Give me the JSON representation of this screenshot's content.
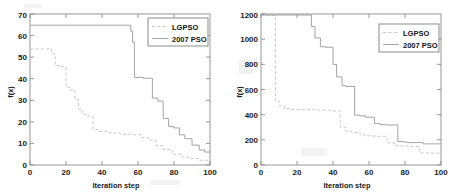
{
  "figure": {
    "panel_count": 2,
    "background_color": "#ffffff"
  },
  "chart_data": [
    {
      "type": "line",
      "panel": "left",
      "title": "",
      "xlabel": "Iteration step",
      "ylabel": "f(x)",
      "xlim": [
        0,
        100
      ],
      "ylim": [
        0,
        70
      ],
      "xticks": [
        0,
        20,
        40,
        60,
        80,
        100
      ],
      "yticks": [
        0,
        10,
        20,
        30,
        40,
        50,
        60,
        70
      ],
      "grid": false,
      "legend_position": "upper right",
      "legend": [
        "LGPSO",
        "2007 PSO"
      ],
      "series": [
        {
          "name": "LGPSO",
          "style": "dashed",
          "color": "#c2c2c2",
          "x": [
            0,
            12,
            12,
            14,
            14,
            17,
            17,
            20,
            20,
            22,
            22,
            25,
            25,
            27,
            27,
            29,
            29,
            31,
            31,
            33,
            33,
            35,
            35,
            38,
            38,
            44,
            44,
            50,
            50,
            56,
            56,
            62,
            62,
            66,
            66,
            70,
            70,
            74,
            74,
            79,
            79,
            84,
            84,
            89,
            89,
            94,
            94,
            100
          ],
          "y": [
            53.8,
            53.8,
            51.5,
            51.5,
            46.2,
            46.2,
            45.6,
            45.6,
            36.0,
            36.0,
            34.8,
            34.8,
            30.5,
            30.5,
            26.0,
            26.0,
            23.5,
            23.5,
            22.8,
            22.8,
            22.5,
            22.5,
            16.5,
            16.5,
            15.6,
            15.6,
            14.9,
            14.9,
            14.2,
            14.2,
            14.0,
            14.0,
            12.8,
            12.8,
            11.6,
            11.6,
            9.0,
            9.0,
            7.2,
            7.2,
            5.0,
            5.0,
            3.7,
            3.7,
            3.0,
            3.0,
            2.2,
            2.2
          ]
        },
        {
          "name": "2007 PSO",
          "style": "solid",
          "color": "#9a9a9a",
          "x": [
            0,
            56,
            56,
            57,
            57,
            58,
            58,
            63,
            63,
            68,
            68,
            71,
            71,
            74,
            74,
            77,
            77,
            80,
            80,
            83,
            83,
            86,
            86,
            90,
            90,
            94,
            94,
            97,
            97,
            100
          ],
          "y": [
            64.8,
            64.8,
            62.0,
            62.0,
            57.0,
            57.0,
            40.6,
            40.6,
            40.2,
            40.2,
            31.0,
            31.0,
            29.6,
            29.6,
            21.5,
            21.5,
            17.8,
            17.8,
            17.2,
            17.2,
            14.0,
            14.0,
            12.2,
            12.2,
            9.2,
            9.2,
            7.0,
            7.0,
            6.0,
            6.0
          ]
        }
      ]
    },
    {
      "type": "line",
      "panel": "right",
      "title": "",
      "xlabel": "Iteration step",
      "ylabel": "f(x)",
      "xlim": [
        0,
        100
      ],
      "ylim": [
        0,
        1200
      ],
      "xticks": [
        0,
        20,
        40,
        60,
        80,
        100
      ],
      "yticks": [
        0,
        200,
        400,
        600,
        800,
        1000,
        1200
      ],
      "grid": false,
      "legend_position": "upper right",
      "legend": [
        "LGPSO",
        "2007 PSO"
      ],
      "series": [
        {
          "name": "LGPSO",
          "style": "dashed",
          "color": "#c2c2c2",
          "x": [
            0,
            8,
            8,
            10,
            10,
            13,
            13,
            16,
            16,
            22,
            22,
            30,
            30,
            38,
            38,
            44,
            44,
            47,
            47,
            50,
            50,
            52,
            52,
            55,
            55,
            58,
            58,
            62,
            62,
            65,
            65,
            70,
            70,
            74,
            74,
            78,
            78,
            82,
            82,
            88,
            88,
            94,
            94,
            100
          ],
          "y": [
            1190,
            1190,
            510,
            510,
            470,
            470,
            448,
            448,
            442,
            442,
            440,
            440,
            436,
            436,
            430,
            430,
            300,
            300,
            272,
            272,
            262,
            262,
            258,
            258,
            240,
            240,
            232,
            232,
            230,
            230,
            228,
            228,
            176,
            176,
            154,
            154,
            150,
            150,
            148,
            148,
            96,
            96,
            94,
            94
          ]
        },
        {
          "name": "2007 PSO",
          "style": "solid",
          "color": "#9a9a9a",
          "x": [
            0,
            28,
            28,
            30,
            30,
            33,
            33,
            36,
            36,
            40,
            40,
            42,
            42,
            45,
            45,
            47,
            47,
            52,
            52,
            55,
            55,
            58,
            58,
            63,
            63,
            66,
            66,
            70,
            70,
            76,
            76,
            79,
            79,
            82,
            82,
            90,
            90,
            100
          ],
          "y": [
            1192,
            1192,
            1100,
            1100,
            1010,
            1010,
            940,
            940,
            936,
            936,
            800,
            800,
            700,
            700,
            630,
            630,
            624,
            624,
            396,
            396,
            390,
            390,
            380,
            380,
            330,
            330,
            320,
            320,
            318,
            318,
            186,
            186,
            182,
            182,
            178,
            178,
            168,
            168
          ]
        }
      ]
    }
  ]
}
